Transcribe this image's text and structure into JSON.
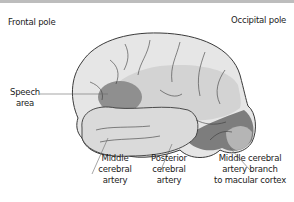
{
  "diagram": {
    "labels": {
      "frontal_pole": "Frontal pole",
      "occipital_pole": "Occipital pole",
      "speech_line1": "Speech",
      "speech_line2": "area",
      "mca_line1": "Middle",
      "mca_line2": "cerebral",
      "mca_line3": "artery",
      "pca_line1": "Posterior",
      "pca_line2": "cerebral",
      "pca_line3": "artery",
      "mcab_line1": "Middle cerebral",
      "mcab_line2": "artery branch",
      "mcab_line3": "to macular cortex"
    },
    "colors": {
      "brain_base": "#e6e6e6",
      "mca_territory": "#cfcfcf",
      "speech_area": "#8f8f8f",
      "posterior_cerebral": "#7d7d7d",
      "macular_branch": "#b5b5b5",
      "outline": "#3a3a3a"
    }
  }
}
